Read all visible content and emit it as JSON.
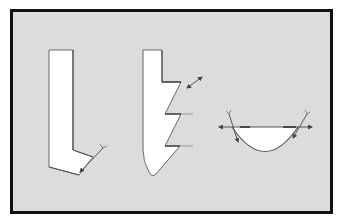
{
  "figure": {
    "background_color": "#dcdcdc",
    "border_color": "#111111",
    "shape_fill": "#ffffff",
    "stroke_color": "#555555",
    "panels": [
      {
        "id": "tool-1",
        "description": "L-shaped cutting tool with angled tip and Y-tipped indicator line"
      },
      {
        "id": "tool-2",
        "description": "Stepped sawtooth tool with reference lines and double arrow"
      },
      {
        "id": "profile-3",
        "description": "Semicircular bowl profile with horizontal double arrow and tangent indicator lines"
      }
    ]
  },
  "caption": {
    "text": ""
  }
}
